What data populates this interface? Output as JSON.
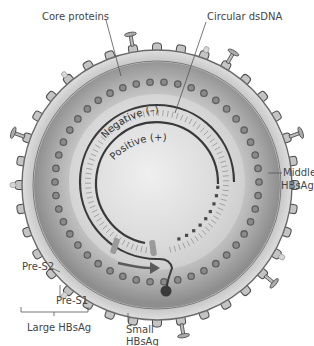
{
  "diagram": {
    "labels": {
      "core_proteins": "Core proteins",
      "circular_dsdna": "Circular dsDNA",
      "negative_strand": "Negative (–)",
      "positive_strand": "Positive (+)",
      "middle_hbsag_1": "Middle",
      "middle_hbsag_2": "HBsAg",
      "pre_s2": "Pre-S2",
      "pre_s1": "Pre-S1",
      "large_hbsag": "Large HBsAg",
      "small_hbsag_1": "Small",
      "small_hbsag_2": "HBsAg"
    },
    "colors": {
      "envelope": "#c8c8c8",
      "envelope_edge": "#707070",
      "capsid_outer": "#9a9a9a",
      "capsid_inner": "#e6e6e6",
      "core_protein_dot": "#6e6e6e",
      "dna_strand": "#3a3a3a",
      "protein_fill": "#bdbdbd",
      "label_text": "#444444"
    },
    "geometry": {
      "center": [
        157,
        185
      ],
      "envelope_radius": 135,
      "capsid_radius": 118,
      "core_dot_radius": 104,
      "negative_strand_radius": 77,
      "positive_strand_radius": 61
    }
  }
}
